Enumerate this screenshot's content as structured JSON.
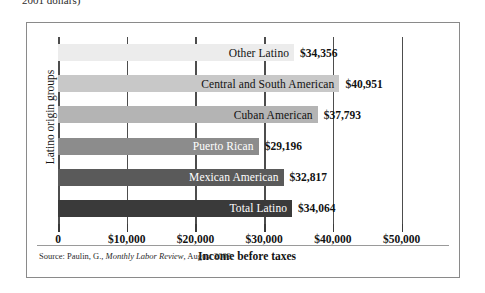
{
  "clipped_caption": "2001 dollars)",
  "chart_data": {
    "type": "bar",
    "orientation": "horizontal",
    "title": "",
    "xlabel": "Income before taxes",
    "ylabel": "Latino origin groups",
    "xlim": [
      0,
      55000
    ],
    "xticks": [
      0,
      10000,
      20000,
      30000,
      40000,
      50000
    ],
    "xtick_labels": [
      "0",
      "$10,000",
      "$20,000",
      "$30,000",
      "$40,000",
      "$50,000"
    ],
    "grid": true,
    "legend": "none",
    "categories": [
      "Other Latino",
      "Central and South American",
      "Cuban American",
      "Puerto Rican",
      "Mexican American",
      "Total Latino"
    ],
    "values": [
      34356,
      40951,
      37793,
      29196,
      32817,
      34064
    ],
    "value_labels": [
      "$34,356",
      "$40,951",
      "$37,793",
      "$29,196",
      "$32,817",
      "$34,064"
    ],
    "bar_colors": [
      "#ececec",
      "#c8c8c8",
      "#b4b4b4",
      "#8c8c8c",
      "#5a5a5a",
      "#3a3a3a"
    ],
    "bar_label_colors": [
      "#121212",
      "#121212",
      "#121212",
      "#ffffff",
      "#ffffff",
      "#ffffff"
    ]
  },
  "source": {
    "prefix": "Source: Paulin, G., ",
    "italic": "Monthly Labor Review",
    "suffix": ", August 2003."
  }
}
